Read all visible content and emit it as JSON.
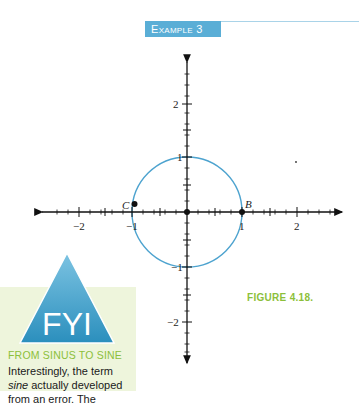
{
  "header": {
    "example_label": "Example 3"
  },
  "graph": {
    "x_ticks": [
      "−2",
      "−1",
      "1",
      "2"
    ],
    "y_ticks": [
      "2",
      "1",
      "−1",
      "−2"
    ],
    "points": [
      {
        "label": "C",
        "x": -1,
        "y": 0.1
      },
      {
        "label": "B",
        "x": 1,
        "y": 0
      }
    ],
    "circle": {
      "center": [
        0,
        0
      ],
      "radius": 1,
      "color": "#4da3cf"
    },
    "origin_point": true
  },
  "fyi": {
    "badge": "FYI",
    "subtitle": "FROM SINUS TO SINE",
    "body_pre": "Interestingly, the term ",
    "body_italic": "sine",
    "body_post": " actually developed from an error. The"
  },
  "figure": {
    "label": "FIGURE 4.18."
  },
  "colors": {
    "accent_blue": "#5aaed6",
    "accent_green": "#8cbf3a",
    "fyi_bg": "#eef5dc"
  }
}
